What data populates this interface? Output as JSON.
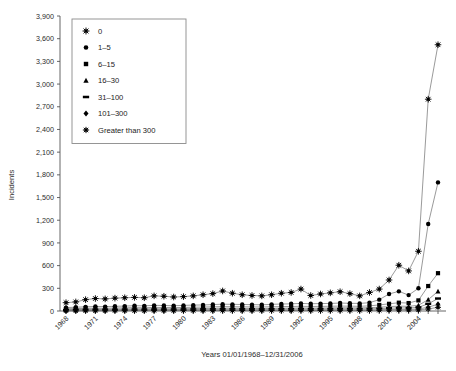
{
  "chart_data": {
    "type": "line",
    "title": "",
    "xlabel": "Years 01/01/1968–12/31/2006",
    "ylabel": "Incidents",
    "ylim": [
      0,
      3900
    ],
    "ytick_step": 300,
    "yticks": [
      "0",
      "300",
      "600",
      "900",
      "1,200",
      "1,500",
      "1,800",
      "2,100",
      "2,400",
      "2,700",
      "3,000",
      "3,300",
      "3,600",
      "3,900"
    ],
    "grid": false,
    "legend_position": "top-left",
    "x": [
      1968,
      1969,
      1970,
      1971,
      1972,
      1973,
      1974,
      1975,
      1976,
      1977,
      1978,
      1979,
      1980,
      1981,
      1982,
      1983,
      1984,
      1985,
      1986,
      1987,
      1988,
      1989,
      1990,
      1991,
      1992,
      1993,
      1994,
      1995,
      1996,
      1997,
      1998,
      1999,
      2000,
      2001,
      2002,
      2003,
      2004,
      2005,
      2006
    ],
    "xticks": [
      "1968",
      "1971",
      "1974",
      "1977",
      "1980",
      "1983",
      "1986",
      "1989",
      "1992",
      "1995",
      "1998",
      "2001",
      "2004"
    ],
    "series": [
      {
        "name": "0",
        "marker": "star",
        "values": [
          110,
          120,
          150,
          165,
          160,
          170,
          175,
          180,
          175,
          200,
          195,
          185,
          190,
          200,
          215,
          230,
          265,
          235,
          215,
          205,
          200,
          215,
          235,
          245,
          290,
          205,
          225,
          240,
          255,
          230,
          200,
          245,
          290,
          410,
          605,
          530,
          790,
          2800,
          3520
        ]
      },
      {
        "name": "1–5",
        "marker": "circle",
        "values": [
          45,
          50,
          55,
          60,
          58,
          62,
          65,
          70,
          68,
          75,
          72,
          70,
          74,
          78,
          80,
          85,
          90,
          88,
          86,
          84,
          82,
          88,
          92,
          95,
          100,
          96,
          98,
          100,
          105,
          102,
          100,
          110,
          150,
          225,
          260,
          210,
          300,
          1150,
          1700
        ]
      },
      {
        "name": "6–15",
        "marker": "square",
        "values": [
          30,
          32,
          35,
          38,
          36,
          40,
          42,
          44,
          42,
          48,
          46,
          45,
          47,
          50,
          52,
          55,
          58,
          56,
          55,
          54,
          53,
          56,
          58,
          60,
          62,
          60,
          61,
          63,
          65,
          64,
          62,
          68,
          80,
          95,
          110,
          105,
          140,
          330,
          500
        ]
      },
      {
        "name": "16–30",
        "marker": "triangle",
        "values": [
          18,
          20,
          22,
          24,
          23,
          25,
          26,
          28,
          27,
          30,
          29,
          28,
          30,
          32,
          33,
          35,
          37,
          36,
          35,
          34,
          33,
          35,
          37,
          38,
          40,
          38,
          39,
          40,
          42,
          41,
          40,
          44,
          50,
          58,
          64,
          62,
          75,
          150,
          260
        ]
      },
      {
        "name": "31–100",
        "marker": "dash",
        "values": [
          12,
          13,
          14,
          15,
          15,
          16,
          17,
          18,
          17,
          19,
          19,
          18,
          19,
          20,
          21,
          22,
          23,
          23,
          22,
          22,
          21,
          23,
          24,
          25,
          26,
          25,
          25,
          26,
          27,
          27,
          26,
          28,
          32,
          37,
          41,
          40,
          48,
          95,
          165
        ]
      },
      {
        "name": "101–300",
        "marker": "diamond",
        "values": [
          6,
          7,
          7,
          8,
          8,
          9,
          9,
          10,
          9,
          10,
          10,
          10,
          10,
          11,
          11,
          12,
          12,
          12,
          12,
          12,
          11,
          12,
          13,
          13,
          14,
          13,
          13,
          14,
          15,
          14,
          14,
          15,
          17,
          20,
          22,
          22,
          26,
          50,
          90
        ]
      },
      {
        "name": "Greater than 300",
        "marker": "starsmall",
        "values": [
          3,
          3,
          4,
          4,
          4,
          5,
          5,
          5,
          5,
          6,
          5,
          5,
          6,
          6,
          6,
          7,
          7,
          7,
          7,
          6,
          6,
          7,
          7,
          7,
          8,
          7,
          7,
          8,
          8,
          8,
          8,
          8,
          9,
          11,
          12,
          12,
          14,
          27,
          48
        ]
      }
    ]
  },
  "legend": {
    "items": [
      {
        "label": "0",
        "marker": "star"
      },
      {
        "label": "1–5",
        "marker": "circle"
      },
      {
        "label": "6–15",
        "marker": "square"
      },
      {
        "label": "16–30",
        "marker": "triangle"
      },
      {
        "label": "31–100",
        "marker": "dash"
      },
      {
        "label": "101–300",
        "marker": "diamond"
      },
      {
        "label": "Greater than 300",
        "marker": "starsmall"
      }
    ]
  },
  "colors": {
    "marker": "#000000",
    "line": "#6f6f6f",
    "axis": "#555555",
    "text": "#1a1a1a",
    "background": "#ffffff"
  }
}
